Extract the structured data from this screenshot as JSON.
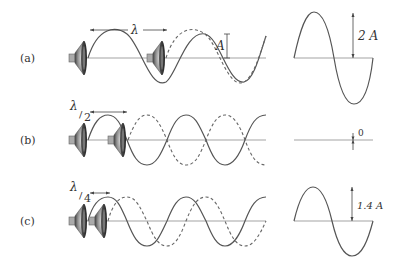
{
  "figure": {
    "rows": [
      {
        "label": "(a)",
        "spacing_label": "λ",
        "spacing_sub": "",
        "phase_shift": "λ",
        "result_label": "2 A",
        "wave_label": "A",
        "interference": "constructive"
      },
      {
        "label": "(b)",
        "spacing_label": "λ",
        "spacing_sub": "2",
        "phase_shift": "λ/2",
        "result_label": "0",
        "interference": "destructive"
      },
      {
        "label": "(c)",
        "spacing_label": "λ",
        "spacing_sub": "4",
        "phase_shift": "λ/4",
        "result_label": "1.4 A",
        "interference": "partial"
      }
    ],
    "colors": {
      "wave": "#555555",
      "axis": "#999999",
      "text": "#333333"
    }
  }
}
